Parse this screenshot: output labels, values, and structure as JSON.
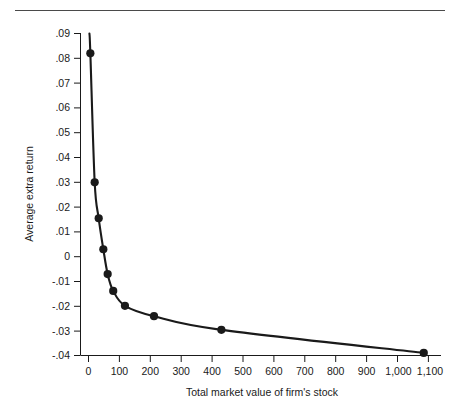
{
  "figure": {
    "has_top_rule": true,
    "background_color": "#ffffff",
    "line_color": "#1a1a1a",
    "marker_color": "#1a1a1a"
  },
  "chart_data": {
    "type": "line",
    "title": "",
    "subtitle": "",
    "xlabel": "Total market value of firm's stock",
    "ylabel": "Average extra return",
    "xlim": [
      -40,
      1180
    ],
    "ylim": [
      -0.04,
      0.09
    ],
    "grid": false,
    "legend": null,
    "x_ticks": [
      0,
      100,
      200,
      300,
      400,
      500,
      600,
      700,
      800,
      900,
      1000,
      1100
    ],
    "x_tick_labels": [
      "0",
      "100",
      "200",
      "300",
      "400",
      "500",
      "600",
      "700",
      "800",
      "900",
      "1,000",
      "1,100"
    ],
    "y_ticks": [
      0.09,
      0.08,
      0.07,
      0.06,
      0.05,
      0.04,
      0.03,
      0.02,
      0.01,
      0,
      -0.01,
      -0.02,
      -0.03,
      -0.04
    ],
    "y_tick_labels": [
      ".09",
      ".08",
      ".07",
      ".06",
      ".05",
      ".04",
      ".03",
      ".02",
      ".01",
      "0",
      "-.01",
      "-.02",
      "-.03",
      "-.04"
    ],
    "series": [
      {
        "name": "Average extra return",
        "marker": "filled-circle",
        "x": [
          6,
          20,
          33,
          48,
          62,
          80,
          118,
          212,
          430,
          1085
        ],
        "values": [
          0.082,
          0.03,
          0.0155,
          0.003,
          -0.007,
          -0.0138,
          -0.0198,
          -0.024,
          -0.0295,
          -0.0388
        ]
      }
    ],
    "curve_start": {
      "x": 3,
      "y": 0.09
    },
    "annotations": []
  }
}
